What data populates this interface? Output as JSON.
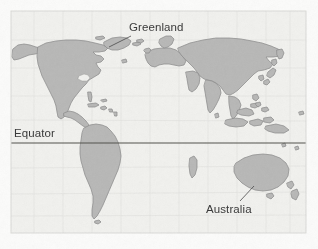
{
  "figure": {
    "kind": "world-map",
    "projection_note": "equirectangular world map",
    "background_color": "#fbfbfa",
    "paper_tint": "#f1f1ee",
    "frame": {
      "visible": true,
      "color": "#d8d8d4",
      "x": 11,
      "y": 11,
      "width": 295,
      "height": 222
    },
    "land": {
      "fill_color": "#b9b9b8",
      "stroke_color": "#8e8e8d"
    },
    "graticule": {
      "visible": true,
      "color": "#e2e2df"
    }
  },
  "labels": {
    "greenland": {
      "text": "Greenland",
      "x": 129,
      "y": 21,
      "leader_from": [
        131,
        36
      ],
      "leader_to": [
        109,
        47
      ]
    },
    "equator": {
      "text": "Equator",
      "x": 14,
      "y": 127
    },
    "australia": {
      "text": "Australia",
      "x": 206,
      "y": 203,
      "leader_from": [
        240,
        201
      ],
      "leader_to": [
        254,
        186
      ]
    }
  },
  "equator_line": {
    "name": "equator",
    "y": 143,
    "x_start": 11,
    "x_end": 306,
    "color": "#55554f",
    "width": 1.1
  },
  "features": [
    {
      "name": "north-america"
    },
    {
      "name": "greenland"
    },
    {
      "name": "south-america"
    },
    {
      "name": "africa"
    },
    {
      "name": "madagascar"
    },
    {
      "name": "europe"
    },
    {
      "name": "asia"
    },
    {
      "name": "arabian-peninsula"
    },
    {
      "name": "india"
    },
    {
      "name": "japan"
    },
    {
      "name": "indonesia"
    },
    {
      "name": "australia"
    },
    {
      "name": "new-zealand"
    },
    {
      "name": "new-guinea"
    },
    {
      "name": "caribbean-islands"
    },
    {
      "name": "british-isles"
    },
    {
      "name": "scandinavia"
    },
    {
      "name": "antarctic-islands"
    }
  ]
}
